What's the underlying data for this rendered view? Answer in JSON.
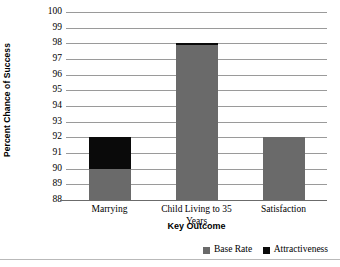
{
  "chart_data": {
    "type": "bar",
    "subtype": "stacked-column",
    "title": "",
    "xlabel": "Key Outcome",
    "ylabel": "Percent Chance of Success",
    "categories": [
      "Marrying",
      "Child Living to 35 Years",
      "Satisfaction"
    ],
    "series": [
      {
        "name": "Base Rate",
        "color": "#6a6a6a",
        "values": [
          90,
          97.9,
          92
        ]
      },
      {
        "name": "Attractiveness",
        "color": "#0a0a0a",
        "values": [
          92,
          98,
          92
        ]
      }
    ],
    "segment_tops": {
      "Marrying": {
        "base_rate_top": 90,
        "attractiveness_top": 92
      },
      "Child Living to 35 Years": {
        "base_rate_top": 97.9,
        "attractiveness_top": 98
      },
      "Satisfaction": {
        "base_rate_top": 92,
        "attractiveness_top": 92
      }
    },
    "ylim": [
      88,
      100
    ],
    "ytick_labels": [
      "100",
      "99",
      "98",
      "97",
      "96",
      "95",
      "94",
      "93",
      "92",
      "91",
      "90",
      "89",
      "88"
    ],
    "ytick_values": [
      100,
      99,
      98,
      97,
      96,
      95,
      94,
      93,
      92,
      91,
      90,
      89,
      88
    ],
    "grid": true,
    "grid_axis": "y",
    "legend_position": "bottom-right",
    "legend_entries": [
      "Base Rate",
      "Attractiveness"
    ]
  },
  "colors": {
    "base_rate": "#6a6a6a",
    "attractiveness": "#0a0a0a",
    "gridline": "#9a9a9a",
    "axis": "#6b6b6b",
    "background": "#ffffff"
  }
}
